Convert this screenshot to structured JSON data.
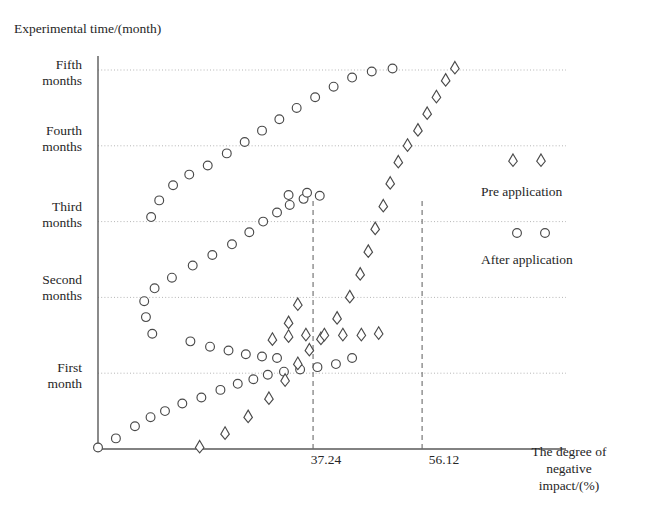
{
  "chart_data": {
    "type": "scatter",
    "title": "",
    "ylabel": "Experimental time/(month)",
    "xlabel": "The degree of negative impact/(%)",
    "xlabel_lines": [
      "The degree of",
      "negative",
      "impact/(%)"
    ],
    "grid": true,
    "legend_position": "right",
    "xlim": [
      0,
      80
    ],
    "ylim": [
      0,
      5.6
    ],
    "xticks": [
      37.24,
      56.12
    ],
    "xtick_labels": [
      "37.24",
      "56.12"
    ],
    "yticks": [
      1,
      2,
      3,
      4,
      5
    ],
    "ytick_labels": [
      [
        "First",
        "month"
      ],
      [
        "Second",
        "months"
      ],
      [
        "Third",
        "months"
      ],
      [
        "Fourth",
        "months"
      ],
      [
        "Fifth",
        "months"
      ]
    ],
    "reference_lines": [
      {
        "x": 37.24,
        "style": "dashed"
      },
      {
        "x": 56.12,
        "style": "dashed"
      }
    ],
    "marker_colors": {
      "axis": "#595959",
      "grid": "#b5b5b5",
      "marker_stroke": "#4a4a4a",
      "marker_fill": "#ffffff",
      "text": "#262626"
    },
    "series": [
      {
        "name": "After application",
        "marker": "circle",
        "points": [
          [
            0.0,
            0.02
          ],
          [
            3.1,
            0.14
          ],
          [
            6.4,
            0.3
          ],
          [
            9.1,
            0.42
          ],
          [
            11.6,
            0.5
          ],
          [
            14.6,
            0.6
          ],
          [
            17.9,
            0.68
          ],
          [
            21.2,
            0.78
          ],
          [
            24.2,
            0.86
          ],
          [
            26.9,
            0.92
          ],
          [
            29.4,
            0.98
          ],
          [
            32.2,
            1.02
          ],
          [
            35.0,
            1.05
          ],
          [
            38.0,
            1.08
          ],
          [
            41.2,
            1.12
          ],
          [
            44.0,
            1.2
          ],
          [
            9.4,
            1.52
          ],
          [
            8.3,
            1.74
          ],
          [
            8.0,
            1.95
          ],
          [
            9.8,
            2.12
          ],
          [
            12.8,
            2.26
          ],
          [
            16.4,
            2.42
          ],
          [
            19.8,
            2.56
          ],
          [
            23.2,
            2.7
          ],
          [
            26.2,
            2.86
          ],
          [
            28.6,
            3.0
          ],
          [
            31.0,
            3.12
          ],
          [
            33.2,
            3.22
          ],
          [
            35.6,
            3.3
          ],
          [
            38.4,
            3.34
          ],
          [
            9.2,
            3.06
          ],
          [
            10.6,
            3.28
          ],
          [
            13.0,
            3.48
          ],
          [
            15.8,
            3.62
          ],
          [
            19.0,
            3.74
          ],
          [
            22.3,
            3.9
          ],
          [
            25.4,
            4.05
          ],
          [
            28.4,
            4.2
          ],
          [
            31.4,
            4.35
          ],
          [
            34.4,
            4.5
          ],
          [
            37.6,
            4.64
          ],
          [
            40.8,
            4.78
          ],
          [
            44.0,
            4.9
          ],
          [
            47.4,
            4.98
          ],
          [
            51.0,
            5.02
          ],
          [
            16.0,
            1.42
          ],
          [
            19.4,
            1.35
          ],
          [
            22.6,
            1.3
          ],
          [
            25.6,
            1.25
          ],
          [
            28.4,
            1.22
          ],
          [
            31.0,
            1.2
          ],
          [
            33.0,
            3.35
          ],
          [
            36.2,
            3.38
          ]
        ]
      },
      {
        "name": "Pre application",
        "marker": "diamond",
        "points": [
          [
            17.6,
            0.02
          ],
          [
            22.0,
            0.2
          ],
          [
            26.0,
            0.42
          ],
          [
            29.6,
            0.66
          ],
          [
            32.4,
            0.9
          ],
          [
            34.6,
            1.12
          ],
          [
            36.6,
            1.3
          ],
          [
            38.6,
            1.45
          ],
          [
            30.2,
            1.44
          ],
          [
            33.0,
            1.48
          ],
          [
            36.0,
            1.5
          ],
          [
            39.2,
            1.5
          ],
          [
            42.4,
            1.5
          ],
          [
            45.6,
            1.5
          ],
          [
            48.6,
            1.52
          ],
          [
            41.4,
            1.72
          ],
          [
            43.6,
            2.0
          ],
          [
            45.4,
            2.3
          ],
          [
            46.8,
            2.6
          ],
          [
            48.0,
            2.9
          ],
          [
            49.4,
            3.2
          ],
          [
            50.6,
            3.5
          ],
          [
            52.0,
            3.78
          ],
          [
            53.6,
            4.0
          ],
          [
            55.4,
            4.2
          ],
          [
            57.0,
            4.42
          ],
          [
            58.6,
            4.64
          ],
          [
            60.2,
            4.86
          ],
          [
            61.8,
            5.02
          ],
          [
            33.0,
            1.66
          ],
          [
            34.6,
            1.9
          ]
        ]
      }
    ]
  },
  "legend": {
    "entries": [
      {
        "label": "Pre application",
        "marker": "diamond"
      },
      {
        "label": "After application",
        "marker": "circle"
      }
    ]
  }
}
